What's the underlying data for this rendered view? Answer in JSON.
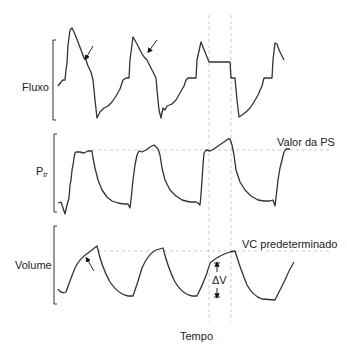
{
  "diagram": {
    "panels": [
      {
        "id": "fluxo",
        "label": "Fluxo"
      },
      {
        "id": "ptr",
        "label": "P",
        "label_sub": "tr",
        "reference_line_label": "Valor da PS"
      },
      {
        "id": "volume",
        "label": "Volume",
        "reference_line_label": "VC predeterminado",
        "delta_label": "ΔV"
      }
    ],
    "x_axis_label": "Tempo",
    "colors": {
      "waveform": "#333333",
      "dashed_guides": "#bbbbbb",
      "text": "#222222",
      "background": "#ffffff"
    }
  }
}
